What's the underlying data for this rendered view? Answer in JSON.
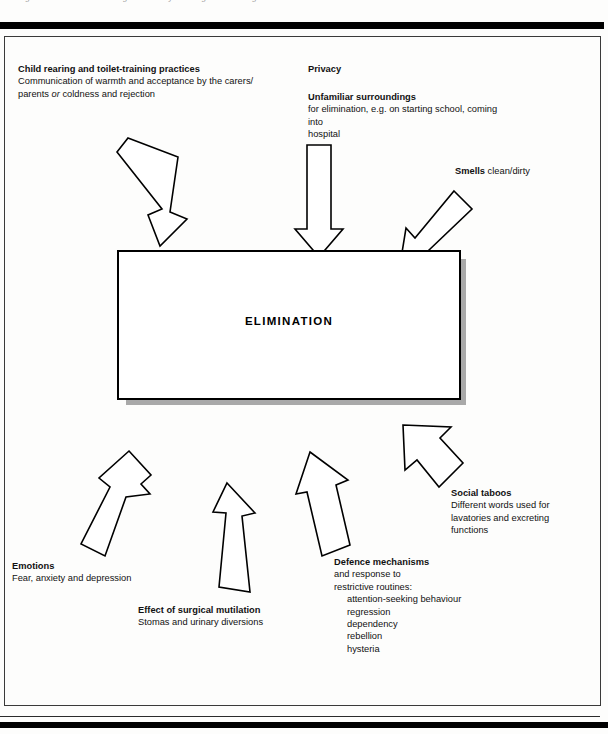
{
  "page": {
    "caption_sliver": "Figure  1   Factors influencing the activity of living : eliminating",
    "center_label": "ELIMINATION"
  },
  "factors": [
    {
      "id": "child-rearing",
      "heading": "Child rearing and toilet-training practices",
      "lines": [
        "Communication of warmth and acceptance by the carers/",
        "parents or coldness and rejection"
      ],
      "italic_word": "or"
    },
    {
      "id": "privacy",
      "heading": "Privacy",
      "lines": []
    },
    {
      "id": "unfamiliar-surroundings",
      "heading": "Unfamiliar surroundings",
      "lines": [
        "for elimination, e.g. on starting school, coming into",
        "hospital"
      ]
    },
    {
      "id": "smells",
      "heading": "Smells",
      "inline_text": "clean/dirty",
      "lines": []
    },
    {
      "id": "social-taboos",
      "heading": "Social taboos",
      "lines": [
        "Different words used for",
        "lavatories and excreting",
        "functions"
      ]
    },
    {
      "id": "defence-mechanisms",
      "heading": "Defence mechanisms",
      "lines": [
        "and response to",
        "restrictive routines:"
      ],
      "sub_lines": [
        "attention-seeking behaviour",
        "regression",
        "dependency",
        "rebellion",
        "hysteria"
      ]
    },
    {
      "id": "emotions",
      "heading": "Emotions",
      "lines": [
        "Fear, anxiety and depression"
      ]
    },
    {
      "id": "effect-of-surgical-mutilation",
      "heading": "Effect of surgical mutilation",
      "lines": [
        "Stomas and urinary diversions"
      ]
    }
  ],
  "colors": {
    "ink": "#000000",
    "paper": "#fdfdfc",
    "shadow": "#a9a9a9",
    "frame": "#3a3a3a"
  }
}
